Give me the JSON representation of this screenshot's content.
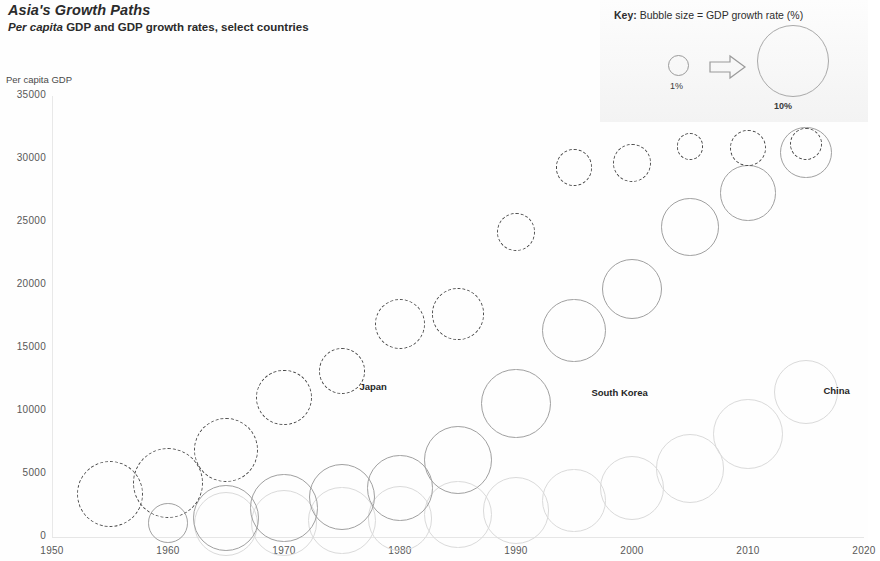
{
  "header": {
    "title": "Asia's Growth Paths",
    "subtitle_italic": "Per capita",
    "subtitle_rest": " GDP and GDP growth rates, select countries"
  },
  "key": {
    "title_bold": "Key:",
    "title_rest": " Bubble size = GDP growth rate (%)",
    "small_label": "1%",
    "big_label": "10%",
    "arrow_name": "arrow-right-icon"
  },
  "chart_data": {
    "type": "scatter",
    "title": "Asia's Growth Paths",
    "subtitle": "Per capita GDP and GDP growth rates, select countries",
    "xlabel": "",
    "ylabel": "Per capita GDP",
    "xlim": [
      1950,
      2020
    ],
    "ylim": [
      0,
      35000
    ],
    "xticks": [
      "1950",
      "1960",
      "1970",
      "1980",
      "1990",
      "2000",
      "2010",
      "2020"
    ],
    "xtick_values": [
      1950,
      1960,
      1970,
      1980,
      1990,
      2000,
      2010,
      2020
    ],
    "yticks": [
      "0",
      "5000",
      "10000",
      "15000",
      "20000",
      "25000",
      "30000",
      "35000"
    ],
    "ytick_values": [
      0,
      5000,
      10000,
      15000,
      20000,
      25000,
      30000,
      35000
    ],
    "grid": false,
    "legend_position": "inline-labels",
    "size_encoding": "Bubble size = GDP growth rate (%)",
    "size_reference": [
      {
        "label": "1%",
        "value": 1
      },
      {
        "label": "10%",
        "value": 10
      }
    ],
    "series": [
      {
        "name": "Japan",
        "style": "dashed",
        "color": "#4a4a4a",
        "label_x": 1976.5,
        "label_y": 11900,
        "points": [
          {
            "x": 1955,
            "y": 3400,
            "size": 8.5
          },
          {
            "x": 1960,
            "y": 4300,
            "size": 9.5
          },
          {
            "x": 1965,
            "y": 6900,
            "size": 8.0
          },
          {
            "x": 1970,
            "y": 11100,
            "size": 6.0
          },
          {
            "x": 1975,
            "y": 13200,
            "size": 4.2
          },
          {
            "x": 1980,
            "y": 16900,
            "size": 5.0
          },
          {
            "x": 1985,
            "y": 17700,
            "size": 5.2
          },
          {
            "x": 1990,
            "y": 24200,
            "size": 3.0
          },
          {
            "x": 1995,
            "y": 29300,
            "size": 2.8
          },
          {
            "x": 2000,
            "y": 29700,
            "size": 3.0
          },
          {
            "x": 2005,
            "y": 31000,
            "size": 1.5
          },
          {
            "x": 2010,
            "y": 30900,
            "size": 2.7
          },
          {
            "x": 2015,
            "y": 31200,
            "size": 2.2
          }
        ]
      },
      {
        "name": "South Korea",
        "style": "solid",
        "color": "#a0a0a0",
        "label_x": 1996.5,
        "label_y": 11400,
        "points": [
          {
            "x": 1960,
            "y": 1100,
            "size": 3.2
          },
          {
            "x": 1965,
            "y": 1500,
            "size": 8.4
          },
          {
            "x": 1970,
            "y": 2300,
            "size": 8.8
          },
          {
            "x": 1975,
            "y": 3200,
            "size": 8.5
          },
          {
            "x": 1980,
            "y": 3900,
            "size": 8.3
          },
          {
            "x": 1985,
            "y": 6100,
            "size": 8.9
          },
          {
            "x": 1990,
            "y": 10600,
            "size": 9.4
          },
          {
            "x": 1995,
            "y": 16400,
            "size": 7.9
          },
          {
            "x": 2000,
            "y": 19700,
            "size": 7.1
          },
          {
            "x": 2005,
            "y": 24600,
            "size": 6.5
          },
          {
            "x": 2010,
            "y": 27300,
            "size": 6.0
          },
          {
            "x": 2015,
            "y": 30500,
            "size": 5.2
          }
        ]
      },
      {
        "name": "China",
        "style": "solid",
        "color": "#dadada",
        "label_x": 2016.5,
        "label_y": 11600,
        "points": [
          {
            "x": 1965,
            "y": 1000,
            "size": 8.0
          },
          {
            "x": 1970,
            "y": 1100,
            "size": 8.6
          },
          {
            "x": 1975,
            "y": 1300,
            "size": 8.9
          },
          {
            "x": 1980,
            "y": 1500,
            "size": 8.2
          },
          {
            "x": 1985,
            "y": 1800,
            "size": 8.8
          },
          {
            "x": 1990,
            "y": 2100,
            "size": 8.6
          },
          {
            "x": 1995,
            "y": 2900,
            "size": 7.8
          },
          {
            "x": 2000,
            "y": 3900,
            "size": 8.0
          },
          {
            "x": 2005,
            "y": 5400,
            "size": 9.2
          },
          {
            "x": 2010,
            "y": 8200,
            "size": 9.4
          },
          {
            "x": 2015,
            "y": 11500,
            "size": 8.1
          }
        ]
      }
    ]
  }
}
